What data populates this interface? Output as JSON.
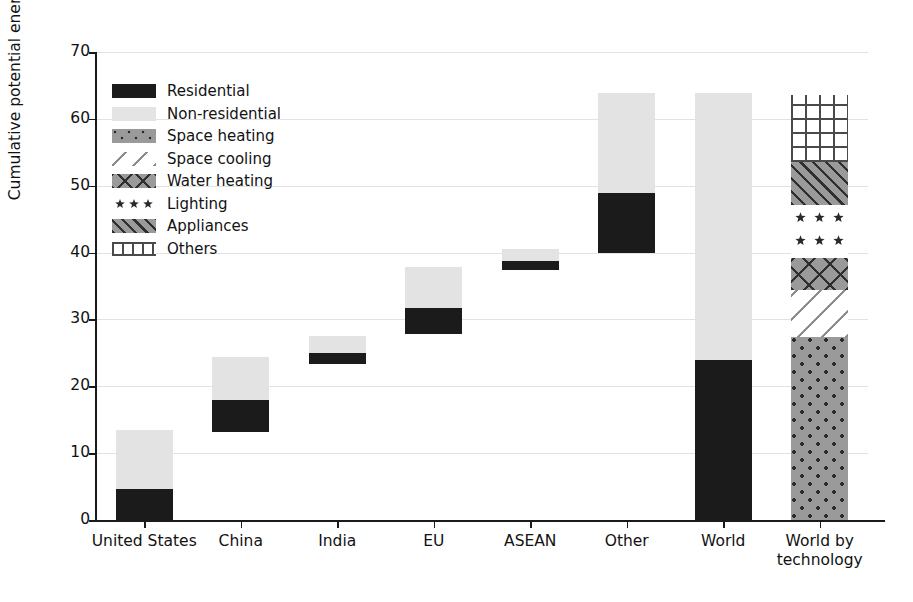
{
  "chart_data": {
    "type": "bar",
    "title": "",
    "xlabel": "",
    "ylabel": "Cumulative potential energy savings (PWh)",
    "ylim": [
      0,
      70
    ],
    "yticks": [
      0,
      10,
      20,
      30,
      40,
      50,
      60,
      70
    ],
    "grid": true,
    "legend_position": "upper left",
    "stacked": true,
    "floating_waterfall": true,
    "categories": [
      "United States",
      "China",
      "India",
      "EU",
      "ASEAN",
      "Other",
      "World",
      "World by technology"
    ],
    "legend_entries": [
      "Residential",
      "Non-residential",
      "Space heating",
      "Space cooling",
      "Water heating",
      "Lighting",
      "Appliances",
      "Others"
    ],
    "series": [
      {
        "name": "Residential",
        "pattern": "solid-black",
        "segments": [
          {
            "category": "United States",
            "bottom": 0.0,
            "top": 4.6,
            "value": 4.6
          },
          {
            "category": "China",
            "bottom": 13.2,
            "top": 17.9,
            "value": 4.7
          },
          {
            "category": "India",
            "bottom": 23.3,
            "top": 25.0,
            "value": 1.7
          },
          {
            "category": "EU",
            "bottom": 27.8,
            "top": 31.7,
            "value": 3.9
          },
          {
            "category": "ASEAN",
            "bottom": 37.4,
            "top": 38.7,
            "value": 1.3
          },
          {
            "category": "Other",
            "bottom": 39.9,
            "top": 48.9,
            "value": 9.0
          },
          {
            "category": "World",
            "bottom": 0.0,
            "top": 23.9,
            "value": 23.9
          }
        ]
      },
      {
        "name": "Non-residential",
        "pattern": "light-gray",
        "segments": [
          {
            "category": "United States",
            "bottom": 4.6,
            "top": 13.4,
            "value": 8.8
          },
          {
            "category": "China",
            "bottom": 17.9,
            "top": 24.4,
            "value": 6.5
          },
          {
            "category": "India",
            "bottom": 25.0,
            "top": 27.5,
            "value": 2.5
          },
          {
            "category": "EU",
            "bottom": 31.7,
            "top": 37.8,
            "value": 6.1
          },
          {
            "category": "ASEAN",
            "bottom": 38.7,
            "top": 40.6,
            "value": 1.9
          },
          {
            "category": "Other",
            "bottom": 48.9,
            "top": 63.8,
            "value": 14.9
          },
          {
            "category": "World",
            "bottom": 23.9,
            "top": 63.8,
            "value": 39.9
          }
        ]
      },
      {
        "name": "Space heating",
        "pattern": "dotted-gray",
        "segments": [
          {
            "category": "World by technology",
            "bottom": 0.0,
            "top": 27.4,
            "value": 27.4
          }
        ]
      },
      {
        "name": "Space cooling",
        "pattern": "diagonal-sparse",
        "segments": [
          {
            "category": "World by technology",
            "bottom": 27.4,
            "top": 34.4,
            "value": 7.0
          }
        ]
      },
      {
        "name": "Water heating",
        "pattern": "crosshatch",
        "segments": [
          {
            "category": "World by technology",
            "bottom": 34.4,
            "top": 39.2,
            "value": 4.8
          }
        ]
      },
      {
        "name": "Lighting",
        "pattern": "stars",
        "segments": [
          {
            "category": "World by technology",
            "bottom": 39.2,
            "top": 47.1,
            "value": 7.9
          }
        ]
      },
      {
        "name": "Appliances",
        "pattern": "diagonal-hatch",
        "segments": [
          {
            "category": "World by technology",
            "bottom": 47.1,
            "top": 53.5,
            "value": 6.4
          }
        ]
      },
      {
        "name": "Others",
        "pattern": "grid",
        "segments": [
          {
            "category": "World by technology",
            "bottom": 53.5,
            "top": 63.5,
            "value": 10.0
          }
        ]
      }
    ]
  },
  "axis": {
    "y_title": "Cumulative potential energy savings (PWh)",
    "y_tick_labels": [
      "0",
      "10",
      "20",
      "30",
      "40",
      "50",
      "60",
      "70"
    ],
    "x_tick_labels": [
      "United States",
      "China",
      "India",
      "EU",
      "ASEAN",
      "Other",
      "World",
      "World by\ntechnology"
    ]
  },
  "legend": {
    "items": [
      {
        "label": "Residential",
        "swatch": "solid-black-swatch"
      },
      {
        "label": "Non-residential",
        "swatch": "light-gray-swatch"
      },
      {
        "label": "Space heating",
        "swatch": "dotted-gray-swatch"
      },
      {
        "label": "Space cooling",
        "swatch": "diagonal-line-swatch"
      },
      {
        "label": "Water heating",
        "swatch": "crosshatch-swatch"
      },
      {
        "label": "Lighting",
        "swatch": "star-swatch"
      },
      {
        "label": "Appliances",
        "swatch": "diagonal-hatch-swatch"
      },
      {
        "label": "Others",
        "swatch": "grid-swatch"
      }
    ]
  },
  "colors": {
    "residential": "#1b1b1b",
    "non_residential": "#e3e3e3",
    "pattern_gray": "#9a9a9a",
    "axis": "#1a1a1a",
    "grid": "#d8d8d8",
    "background": "#ffffff"
  }
}
